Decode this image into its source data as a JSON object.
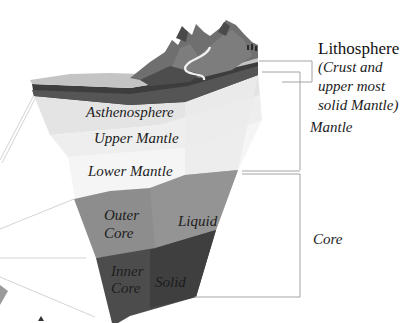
{
  "diagram": {
    "layers": {
      "asthenosphere": "Asthenosphere",
      "upper_mantle": "Upper Mantle",
      "lower_mantle": "Lower Mantle",
      "outer_core_line1": "Outer",
      "outer_core_line2": "Core",
      "liquid": "Liquid",
      "inner_core_line1": "Inner",
      "inner_core_line2": "Core",
      "solid": "Solid"
    },
    "side_labels": {
      "lithosphere": "Lithosphere",
      "lithosphere_note": "(Crust and\nupper most\nsolid Mantle)",
      "mantle": "Mantle",
      "core": "Core"
    },
    "colors": {
      "crust_top": "#c9c9c9",
      "lithosphere_dark": "#3a3a3a",
      "lithosphere_mid": "#5a5a5a",
      "asthenosphere": "#e6e6e6",
      "upper_mantle": "#f0f0f0",
      "lower_mantle": "#f6f6f6",
      "outer_core": "#8c8c8c",
      "inner_core": "#4a4a4a",
      "mountains": "#6e6e6e",
      "leader_lines": "#9a9a9a"
    }
  }
}
